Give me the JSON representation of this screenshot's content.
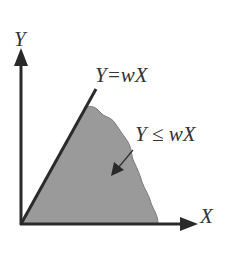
{
  "diagram": {
    "axes": {
      "y_label": "Y",
      "x_label": "X"
    },
    "line": {
      "label": "Y=wX"
    },
    "region": {
      "label": "Y ≤ wX"
    },
    "colors": {
      "axis": "#2a2a2a",
      "shade_fill": "#9a9a9a",
      "shade_edge": "#6e6e6e",
      "text": "#333333"
    }
  }
}
